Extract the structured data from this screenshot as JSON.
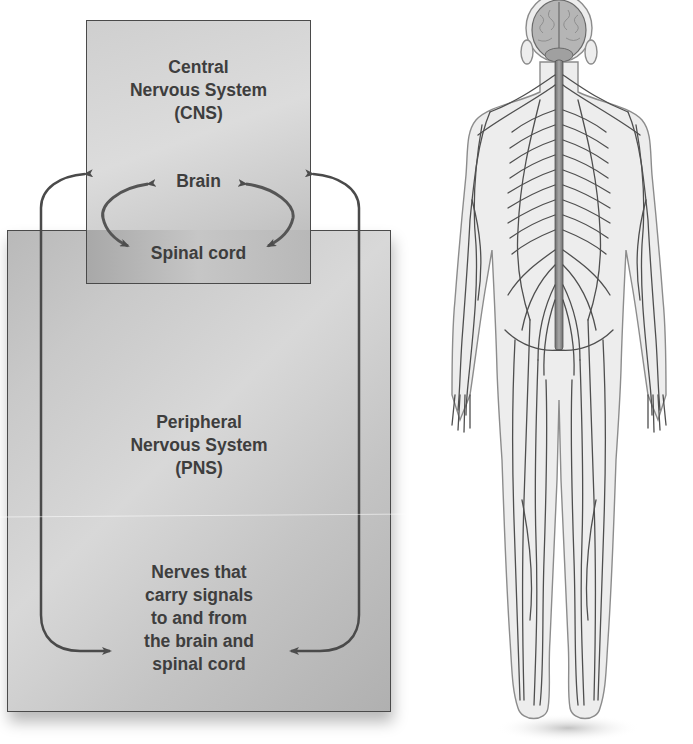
{
  "diagram": {
    "cns": {
      "title_lines": [
        "Central",
        "Nervous System",
        "(CNS)"
      ],
      "components": {
        "brain": "Brain",
        "spinal_cord": "Spinal cord"
      },
      "fill_color": "#d6d6d6"
    },
    "pns": {
      "title_lines": [
        "Peripheral",
        "Nervous System",
        "(PNS)"
      ],
      "description_lines": [
        "Nerves that",
        "carry signals",
        "to and from",
        "the brain and",
        "spinal cord"
      ],
      "fill_color": "#c4c4c4"
    },
    "arrows": [
      {
        "from": "brain",
        "to": "spinal_cord",
        "type": "bidirectional",
        "side": "left"
      },
      {
        "from": "brain",
        "to": "spinal_cord",
        "type": "bidirectional",
        "side": "right"
      },
      {
        "from": "pns_nerves",
        "to": "cns",
        "type": "bidirectional",
        "side": "left"
      },
      {
        "from": "pns_nerves",
        "to": "cns",
        "type": "bidirectional",
        "side": "right"
      }
    ],
    "border_color": "#4a4a4a",
    "text_color": "#3e3e3e"
  },
  "illustration": {
    "subject": "human body, posterior view, showing brain, spinal cord and peripheral nerves",
    "icons": [
      "brain-icon",
      "spinal-cord-icon",
      "nerves-icon"
    ]
  }
}
